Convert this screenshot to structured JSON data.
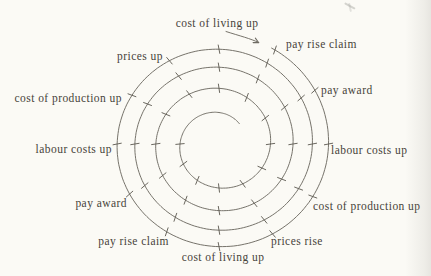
{
  "diagram": {
    "labels": [
      {
        "text": "cost of living up"
      },
      {
        "text": "pay rise claim"
      },
      {
        "text": "pay award"
      },
      {
        "text": "labour costs up"
      },
      {
        "text": "cost of production up"
      },
      {
        "text": "prices rise"
      },
      {
        "text": "cost of living up"
      },
      {
        "text": "pay rise claim"
      },
      {
        "text": "pay award"
      },
      {
        "text": "labour costs up"
      },
      {
        "text": "cost of production up"
      },
      {
        "text": "prices up"
      }
    ],
    "spiral": {
      "direction": "clockwise-inward",
      "turns": 4.05,
      "center_x": 219,
      "center_y": 144,
      "y_scale": 0.97,
      "outer_radius": 112,
      "inner_radius": 29,
      "decay_linear": 14,
      "decay_quad": 1.6,
      "start_angle_deg": -62,
      "sweep_deg": 1457,
      "tick_every_deg": 30,
      "tick_start_deg": 2,
      "tick_min_radius": 38,
      "tick_tilt_deg": 78,
      "tick_len": 8.5
    },
    "colors": {
      "ink": "#47433a",
      "line": "#6f6c63",
      "background": "#fbfaf5"
    }
  }
}
